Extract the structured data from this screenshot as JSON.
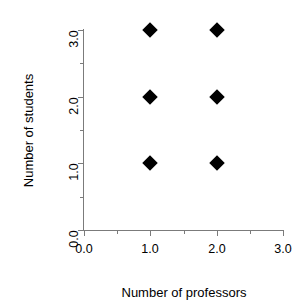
{
  "chart_data": {
    "type": "scatter",
    "title": "",
    "xlabel": "Number of professors",
    "ylabel": "Number of students",
    "xlim": [
      0.0,
      3.0
    ],
    "ylim": [
      0.0,
      3.0
    ],
    "xticks": [
      "0.0",
      "1.0",
      "2.0",
      "3.0"
    ],
    "yticks": [
      "0.0",
      "1.0",
      "2.0",
      "3.0"
    ],
    "xtick_values": [
      0.0,
      1.0,
      2.0,
      3.0
    ],
    "ytick_values": [
      0.0,
      1.0,
      2.0,
      3.0
    ],
    "minor_tick_values_x": [
      0.5,
      1.5,
      2.5
    ],
    "minor_tick_values_y": [
      0.5,
      1.5,
      2.5
    ],
    "grid": false,
    "legend": "none",
    "marker": "filled-diamond",
    "marker_color": "#000000",
    "axis_color": "#7b7b7b",
    "background_color": "#ffffff",
    "points": [
      {
        "x": 1.0,
        "y": 1.0
      },
      {
        "x": 1.0,
        "y": 2.0
      },
      {
        "x": 1.0,
        "y": 3.0
      },
      {
        "x": 2.0,
        "y": 1.0
      },
      {
        "x": 2.0,
        "y": 2.0
      },
      {
        "x": 2.0,
        "y": 3.0
      }
    ]
  }
}
